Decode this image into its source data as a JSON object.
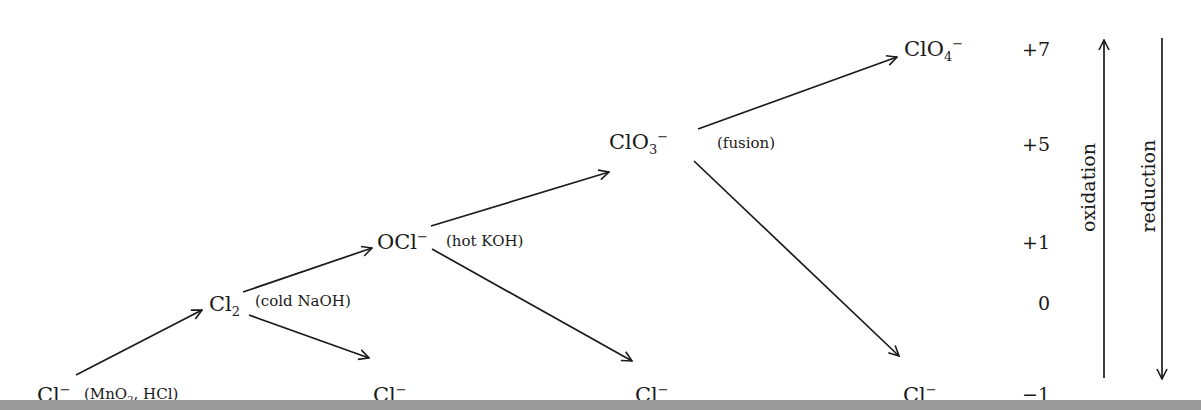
{
  "diagram": {
    "type": "chlorine oxidation-state pathway",
    "species": {
      "cl_start": {
        "base": "Cl",
        "sup": "−"
      },
      "cl2": {
        "base": "Cl",
        "sub": "2"
      },
      "cl_from_cl2": {
        "base": "Cl",
        "sup": "−"
      },
      "ocl": {
        "base": "OCl",
        "sup": "−"
      },
      "cl_from_ocl": {
        "base": "Cl",
        "sup": "−"
      },
      "clo3": {
        "base": "ClO",
        "sub": "3",
        "sup": "−"
      },
      "cl_from_clo3": {
        "base": "Cl",
        "sup": "−"
      },
      "clo4": {
        "base": "ClO",
        "sub": "4",
        "sup": "−"
      }
    },
    "conditions": {
      "step1": {
        "pre": "(MnO",
        "sub": "2",
        "post": ", HCl)"
      },
      "step2": "(cold NaOH)",
      "step3": "(hot KOH)",
      "step4": "(fusion)"
    },
    "oxidation_states": [
      "+7",
      "+5",
      "+1",
      "0",
      "−1"
    ],
    "axis_labels": {
      "oxidation": "oxidation",
      "reduction": "reduction"
    },
    "colors": {
      "ink": "#1a1a1a",
      "background": "#ffffff",
      "bottom_band": "#9a9a9a"
    }
  }
}
